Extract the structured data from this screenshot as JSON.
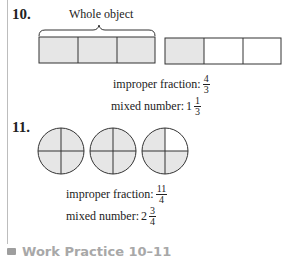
{
  "problem10": {
    "number": "10.",
    "brace_label": "Whole object",
    "improper_label": "improper fraction:",
    "improper_num": "4",
    "improper_den": "3",
    "mixed_label": "mixed number:",
    "mixed_whole": "1",
    "mixed_num": "1",
    "mixed_den": "3",
    "bars": [
      {
        "parts": 3,
        "shaded": 3
      },
      {
        "parts": 3,
        "shaded": 1
      }
    ]
  },
  "problem11": {
    "number": "11.",
    "improper_label": "improper fraction:",
    "improper_num": "11",
    "improper_den": "4",
    "mixed_label": "mixed number:",
    "mixed_whole": "2",
    "mixed_num": "3",
    "mixed_den": "4",
    "circles": [
      {
        "parts": 4,
        "shaded": 4
      },
      {
        "parts": 4,
        "shaded": 4
      },
      {
        "parts": 4,
        "shaded": 3
      }
    ]
  },
  "footer": {
    "text": "Work Practice 10–11"
  },
  "colors": {
    "shade": "#e6e6e6",
    "stroke": "#333333",
    "footer_text": "#a8a8a8"
  }
}
